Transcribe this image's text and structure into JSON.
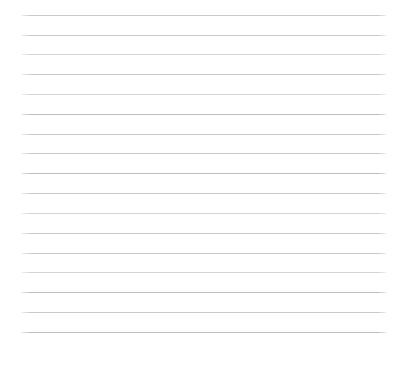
{
  "page": {
    "kind": "lined-paper-sheet",
    "width": 407,
    "height": 370,
    "background_color": "#ffffff",
    "text_content": "",
    "has_text": false,
    "has_header": false,
    "has_margin_rule": false
  },
  "ruling": {
    "line_count": 17,
    "line_color": "#c9c9c9",
    "line_color_dark": "#bdbdbd",
    "line_color_light": "#d4d4d4",
    "line_thickness_px": 1,
    "line_left_px": 21,
    "line_right_px": 386,
    "line_width_px": 365,
    "first_line_y_px": 15,
    "last_line_y_px": 332,
    "line_spacing_px": 19.8,
    "bottom_blank_space_px": 38,
    "lines": [
      {
        "index": 1,
        "y": 15,
        "shade": "default"
      },
      {
        "index": 2,
        "y": 35,
        "shade": "default"
      },
      {
        "index": 3,
        "y": 54,
        "shade": "light"
      },
      {
        "index": 4,
        "y": 74,
        "shade": "default"
      },
      {
        "index": 5,
        "y": 94,
        "shade": "light"
      },
      {
        "index": 6,
        "y": 114,
        "shade": "dark"
      },
      {
        "index": 7,
        "y": 134,
        "shade": "default"
      },
      {
        "index": 8,
        "y": 153,
        "shade": "default"
      },
      {
        "index": 9,
        "y": 173,
        "shade": "dark"
      },
      {
        "index": 10,
        "y": 193,
        "shade": "default"
      },
      {
        "index": 11,
        "y": 213,
        "shade": "light"
      },
      {
        "index": 12,
        "y": 233,
        "shade": "default"
      },
      {
        "index": 13,
        "y": 253,
        "shade": "default"
      },
      {
        "index": 14,
        "y": 272,
        "shade": "light"
      },
      {
        "index": 15,
        "y": 292,
        "shade": "dark"
      },
      {
        "index": 16,
        "y": 312,
        "shade": "default"
      },
      {
        "index": 17,
        "y": 332,
        "shade": "dark"
      }
    ]
  }
}
